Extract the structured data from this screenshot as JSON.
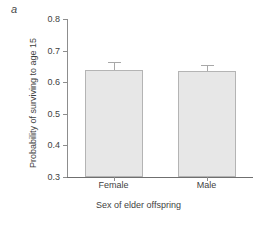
{
  "panel": {
    "label": "a"
  },
  "chart_data": {
    "type": "bar",
    "title": "",
    "xlabel": "Sex of elder offspring",
    "ylabel": "Probability of surviving to age 15",
    "categories": [
      "Female",
      "Male"
    ],
    "values": [
      0.64,
      0.635
    ],
    "errors": [
      0.025,
      0.02
    ],
    "ylim": [
      0.3,
      0.8
    ],
    "yticks": [
      0.3,
      0.4,
      0.5,
      0.6,
      0.7,
      0.8
    ],
    "ytick_labels": [
      "0.3",
      "0.4",
      "0.5",
      "0.6",
      "0.7",
      "0.8"
    ],
    "grid": false,
    "legend": "none",
    "series": [
      {
        "name": "Probability of surviving to age 15",
        "values": [
          0.64,
          0.635
        ],
        "errors": [
          0.025,
          0.02
        ]
      }
    ],
    "colors": {
      "bar_fill": "#e7e7e7",
      "bar_border": "#b4b4b4",
      "axis": "#8d8d8d",
      "text": "#3f3f3f"
    }
  }
}
